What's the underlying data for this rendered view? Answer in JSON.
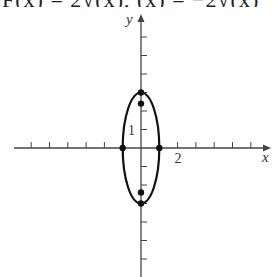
{
  "header": {
    "cropped_formula_text": "F(x) = 2√(x), (x) = −2√(x)"
  },
  "chart_data": {
    "type": "scatter",
    "title": "",
    "xlabel": "x",
    "ylabel": "y",
    "xlim": [
      -7,
      7
    ],
    "ylim": [
      -7,
      7
    ],
    "grid": false,
    "tick_step": 1,
    "x_ticks": [
      -6,
      -5,
      -4,
      -3,
      -2,
      -1,
      1,
      2,
      3,
      4,
      5,
      6
    ],
    "y_ticks": [
      -6,
      -5,
      -4,
      -3,
      -2,
      -1,
      1,
      2,
      3,
      4,
      5,
      6
    ],
    "tick_labels": {
      "x": [
        {
          "value": 2,
          "text": "2"
        }
      ],
      "y": [
        {
          "value": 1,
          "text": "1"
        }
      ]
    },
    "curves": [
      {
        "name": "ellipse",
        "shape": "ellipse",
        "center": [
          0,
          0
        ],
        "semi_axis_x": 1,
        "semi_axis_y": 3
      }
    ],
    "points": [
      {
        "x": 0,
        "y": 3,
        "label": "vertex-top"
      },
      {
        "x": 0,
        "y": -3,
        "label": "vertex-bottom"
      },
      {
        "x": -1,
        "y": 0,
        "label": "covertex-left"
      },
      {
        "x": 1,
        "y": 0,
        "label": "covertex-right"
      },
      {
        "x": 0,
        "y": 2.4,
        "label": "focus-top"
      },
      {
        "x": 0,
        "y": -2.4,
        "label": "focus-bottom"
      }
    ],
    "colors": {
      "axis": "#444444",
      "curve": "#111111",
      "point": "#111111"
    }
  }
}
